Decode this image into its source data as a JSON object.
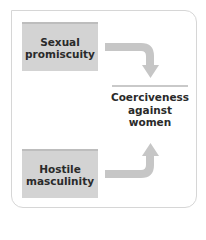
{
  "diagram": {
    "nodes": [
      {
        "id": "sexual-promiscuity",
        "label": "Sexual promiscuity",
        "lines": [
          "Sexual",
          "promiscuity"
        ]
      },
      {
        "id": "hostile-masculinity",
        "label": "Hostile masculinity",
        "lines": [
          "Hostile",
          "masculinity"
        ]
      },
      {
        "id": "coerciveness",
        "label": "Coerciveness against women",
        "lines": [
          "Coerciveness",
          "against",
          "women"
        ]
      }
    ],
    "edges": [
      {
        "from": "sexual-promiscuity",
        "to": "coerciveness"
      },
      {
        "from": "hostile-masculinity",
        "to": "coerciveness"
      }
    ],
    "colors": {
      "box_fill": "#d3d3d3",
      "arrow": "#c6c6c6",
      "frame": "#d6d6d6",
      "text": "#2a2a2a"
    }
  }
}
